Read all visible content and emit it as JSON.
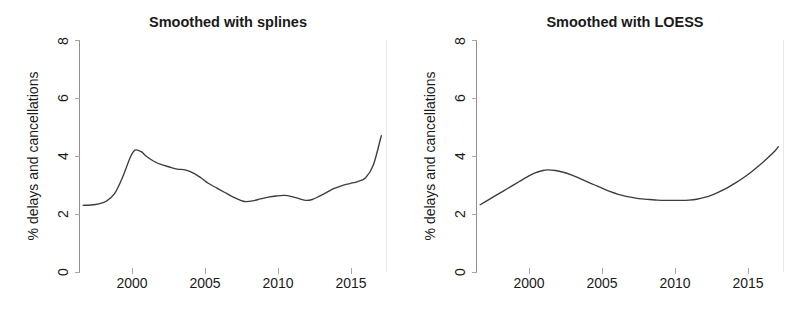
{
  "figure": {
    "background": "#ffffff",
    "curve_color": "#3c3c3c",
    "axis_color": "#909090",
    "text_color": "#1a1a1a"
  },
  "panels": [
    {
      "id": "splines",
      "title": "Smoothed with splines",
      "ylabel": "% delays and cancellations",
      "xlabel": "",
      "y_ticks": [
        "0",
        "2",
        "4",
        "6",
        "8"
      ],
      "x_ticks": [
        "2000",
        "2005",
        "2010",
        "2015"
      ]
    },
    {
      "id": "loess",
      "title": "Smoothed with LOESS",
      "ylabel": "% delays and cancellations",
      "xlabel": "",
      "y_ticks": [
        "0",
        "2",
        "4",
        "6",
        "8"
      ],
      "x_ticks": [
        "2000",
        "2005",
        "2010",
        "2015"
      ]
    }
  ],
  "chart_data": [
    {
      "type": "line",
      "title": "Smoothed with splines",
      "xlabel": "",
      "ylabel": "% delays and cancellations",
      "xlim": [
        1996.8,
        2016.3
      ],
      "ylim": [
        0,
        8
      ],
      "ytick_values": [
        0,
        2,
        4,
        6,
        8
      ],
      "xtick_values": [
        2000,
        2005,
        2010,
        2015
      ],
      "grid": false,
      "legend": "none",
      "series": [
        {
          "name": "% delays and cancellations (spline smooth)",
          "x": [
            1997.0,
            1997.5,
            1998.0,
            1998.5,
            1999.0,
            1999.5,
            2000.0,
            2000.3,
            2000.7,
            2001.0,
            2001.5,
            2002.0,
            2002.5,
            2003.0,
            2003.5,
            2004.0,
            2004.5,
            2005.0,
            2005.5,
            2006.0,
            2006.5,
            2007.0,
            2007.3,
            2007.8,
            2008.3,
            2008.8,
            2009.3,
            2009.8,
            2010.3,
            2010.8,
            2011.2,
            2011.6,
            2012.0,
            2012.5,
            2013.0,
            2013.5,
            2014.0,
            2014.5,
            2015.0,
            2015.5,
            2016.0
          ],
          "y": [
            2.3,
            2.31,
            2.35,
            2.45,
            2.7,
            3.25,
            3.95,
            4.2,
            4.15,
            4.0,
            3.82,
            3.7,
            3.62,
            3.55,
            3.52,
            3.42,
            3.25,
            3.05,
            2.9,
            2.75,
            2.6,
            2.48,
            2.43,
            2.45,
            2.52,
            2.58,
            2.62,
            2.64,
            2.6,
            2.52,
            2.47,
            2.5,
            2.6,
            2.74,
            2.88,
            2.98,
            3.05,
            3.12,
            3.25,
            3.7,
            4.7
          ]
        }
      ]
    },
    {
      "type": "line",
      "title": "Smoothed with LOESS",
      "xlabel": "",
      "ylabel": "% delays and cancellations",
      "xlim": [
        1996.8,
        2016.3
      ],
      "ylim": [
        0,
        8
      ],
      "ytick_values": [
        0,
        2,
        4,
        6,
        8
      ],
      "xtick_values": [
        2000,
        2005,
        2010,
        2015
      ],
      "grid": false,
      "legend": "none",
      "series": [
        {
          "name": "% delays and cancellations (LOESS smooth)",
          "x": [
            1997.0,
            1997.5,
            1998.0,
            1998.5,
            1999.0,
            1999.5,
            2000.0,
            2000.5,
            2001.0,
            2001.3,
            2001.8,
            2002.3,
            2002.8,
            2003.3,
            2003.8,
            2004.3,
            2004.8,
            2005.3,
            2005.8,
            2006.3,
            2006.8,
            2007.3,
            2007.8,
            2008.3,
            2008.8,
            2009.3,
            2009.8,
            2010.3,
            2010.8,
            2011.3,
            2011.8,
            2012.3,
            2012.8,
            2013.3,
            2013.8,
            2014.3,
            2014.8,
            2015.3,
            2015.8,
            2016.0
          ],
          "y": [
            2.32,
            2.48,
            2.64,
            2.8,
            2.96,
            3.12,
            3.28,
            3.42,
            3.5,
            3.52,
            3.5,
            3.44,
            3.35,
            3.24,
            3.12,
            3.0,
            2.88,
            2.77,
            2.68,
            2.61,
            2.56,
            2.52,
            2.5,
            2.48,
            2.47,
            2.47,
            2.47,
            2.48,
            2.51,
            2.57,
            2.66,
            2.78,
            2.92,
            3.08,
            3.26,
            3.46,
            3.68,
            3.92,
            4.18,
            4.32
          ]
        }
      ]
    }
  ]
}
